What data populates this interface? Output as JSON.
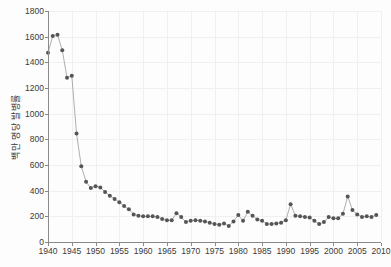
{
  "chart": {
    "title": "",
    "ylabel": "백만 명당 발병률",
    "xlabel": ""
  },
  "axes": {
    "y_ticks": [
      "0",
      "200",
      "400",
      "600",
      "800",
      "1000",
      "1200",
      "1400",
      "1600",
      "1800"
    ],
    "x_ticks": [
      "1940",
      "1945",
      "1950",
      "1955",
      "1960",
      "1965",
      "1970",
      "1975",
      "1980",
      "1985",
      "1990",
      "1995",
      "2000",
      "2005",
      "2010"
    ]
  },
  "colors": {
    "marker": "#555558",
    "line": "#9a9a9a",
    "axis": "#8a8a8a",
    "grid": "#f0f0f0",
    "background": "#fdfdfd"
  },
  "chart_data": {
    "type": "line",
    "title": "",
    "xlabel": "",
    "ylabel": "백만 명당 발병률",
    "xlim": [
      1940,
      2010
    ],
    "ylim": [
      0,
      1800
    ],
    "grid": true,
    "legend": "none",
    "x": [
      1940,
      1941,
      1942,
      1943,
      1944,
      1945,
      1946,
      1947,
      1948,
      1949,
      1950,
      1951,
      1952,
      1953,
      1954,
      1955,
      1956,
      1957,
      1958,
      1959,
      1960,
      1961,
      1962,
      1963,
      1964,
      1965,
      1966,
      1967,
      1968,
      1969,
      1970,
      1971,
      1972,
      1973,
      1974,
      1975,
      1976,
      1977,
      1978,
      1979,
      1980,
      1981,
      1982,
      1983,
      1984,
      1985,
      1986,
      1987,
      1988,
      1989,
      1990,
      1991,
      1992,
      1993,
      1994,
      1995,
      1996,
      1997,
      1998,
      1999,
      2000,
      2001,
      2002,
      2003,
      2004,
      2005,
      2006,
      2007,
      2008,
      2009
    ],
    "values": [
      1475,
      1605,
      1615,
      1495,
      1280,
      1295,
      845,
      590,
      470,
      420,
      435,
      425,
      390,
      360,
      335,
      310,
      280,
      255,
      215,
      205,
      200,
      200,
      200,
      195,
      180,
      170,
      170,
      225,
      195,
      155,
      165,
      170,
      165,
      160,
      150,
      140,
      135,
      145,
      125,
      160,
      210,
      165,
      235,
      205,
      175,
      165,
      140,
      140,
      145,
      150,
      170,
      295,
      205,
      200,
      195,
      190,
      165,
      140,
      155,
      195,
      185,
      185,
      220,
      355,
      250,
      215,
      195,
      200,
      195,
      210
    ],
    "series": [
      {
        "name": "발병률",
        "values": [
          1475,
          1605,
          1615,
          1495,
          1280,
          1295,
          845,
          590,
          470,
          420,
          435,
          425,
          390,
          360,
          335,
          310,
          280,
          255,
          215,
          205,
          200,
          200,
          200,
          195,
          180,
          170,
          170,
          225,
          195,
          155,
          165,
          170,
          165,
          160,
          150,
          140,
          135,
          145,
          125,
          160,
          210,
          165,
          235,
          205,
          175,
          165,
          140,
          140,
          145,
          150,
          170,
          295,
          205,
          200,
          195,
          190,
          165,
          140,
          155,
          195,
          185,
          185,
          220,
          355,
          250,
          215,
          195,
          200,
          195,
          210
        ]
      }
    ],
    "annotations": [
      {
        "x": 1942,
        "y": 1615,
        "note": "peak"
      },
      {
        "x": 1967,
        "y": 225,
        "note": "local peak"
      },
      {
        "x": 1982,
        "y": 235,
        "note": "local peak"
      },
      {
        "x": 1991,
        "y": 295,
        "note": "local peak"
      },
      {
        "x": 2003,
        "y": 355,
        "note": "local peak"
      }
    ]
  }
}
